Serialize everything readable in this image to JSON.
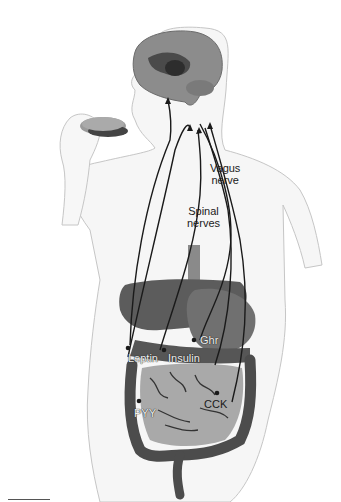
{
  "diagram": {
    "labels": {
      "vagus": [
        "Vagus",
        "nerve"
      ],
      "spinal": [
        "Spinal",
        "nerves"
      ],
      "ghrelin": "Ghr",
      "leptin": "Leptin",
      "insulin": "Insulin",
      "cck": "CCK",
      "pyy": "PYY"
    },
    "colors": {
      "skin_outline": "#c8c8c8",
      "brain": "#8a8a8a",
      "liver": "#5a5a5a",
      "stomach": "#6e6e6e",
      "small_intestine": "#a8a8a8",
      "colon": "#4a4a4a",
      "nerve_lines": "#1a1a1a",
      "background": "#ffffff"
    }
  }
}
